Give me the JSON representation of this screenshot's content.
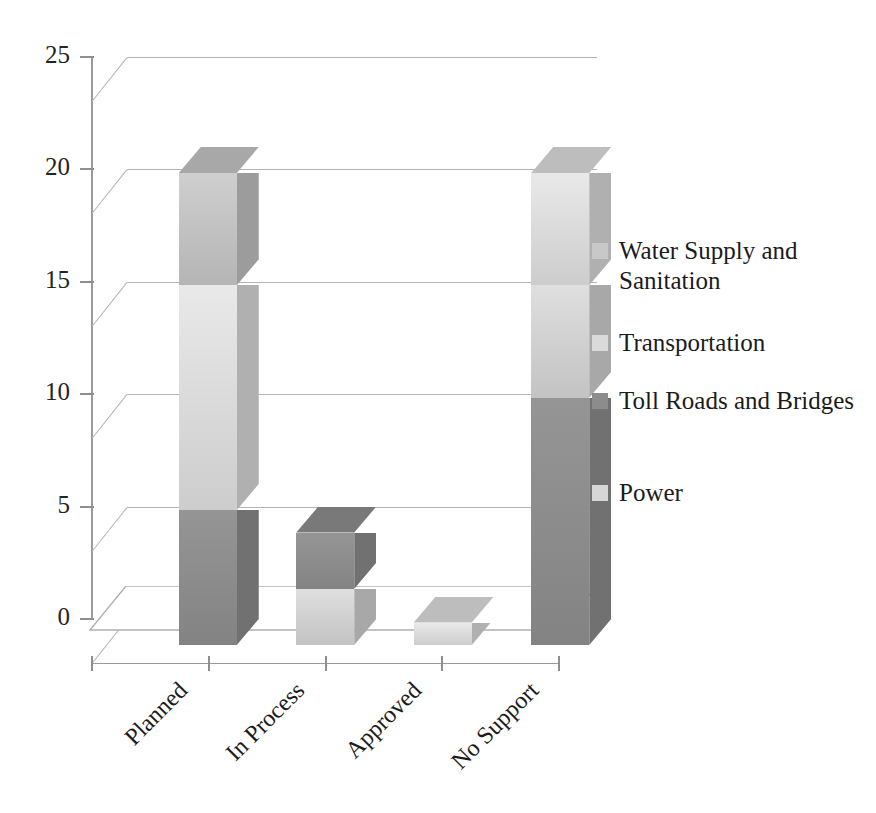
{
  "chart_data": {
    "type": "bar",
    "subtype": "stacked-column-3d",
    "title": "",
    "xlabel": "",
    "ylabel": "",
    "categories": [
      "Planned",
      "In Process",
      "Approved",
      "No Support"
    ],
    "ylim": [
      0,
      25
    ],
    "yticks": [
      0,
      5,
      10,
      15,
      20,
      25
    ],
    "ytick_labels": [
      "0",
      "5",
      "10",
      "15",
      "20",
      "25"
    ],
    "grid": true,
    "legend_position": "right",
    "series": [
      {
        "name": "Water Supply and Sanitation",
        "color": "#c3c3c3",
        "values": [
          5,
          0,
          0,
          0
        ]
      },
      {
        "name": "Transportation",
        "color": "#dcdcdc",
        "values": [
          10,
          0,
          1,
          5
        ]
      },
      {
        "name": "Toll Roads and Bridges",
        "color": "#8d8d8d",
        "values": [
          6,
          2.5,
          0,
          11
        ]
      },
      {
        "name": "Power",
        "color": "#d2d2d2",
        "values": [
          0,
          2.5,
          0,
          5
        ]
      }
    ],
    "totals": [
      21,
      5,
      1,
      21
    ]
  },
  "legend": {
    "items": [
      {
        "label": "Water Supply and Sanitation",
        "color": "#c8c8c8"
      },
      {
        "label": "Transportation",
        "color": "#dadada"
      },
      {
        "label": "Toll Roads and Bridges",
        "color": "#8c8c8c"
      },
      {
        "label": "Power",
        "color": "#d6d6d6"
      }
    ]
  },
  "axis": {
    "y_labels": [
      "25",
      "20",
      "15",
      "10",
      "5",
      "0"
    ],
    "x_labels": [
      "Planned",
      "In Process",
      "Approved",
      "No Support"
    ]
  },
  "colors": {
    "grid": "#b4b4b4",
    "axis": "#9a9a9a",
    "text": "#1b1b1b",
    "floor_fill": "#ffffff",
    "floor_stroke": "#b0b0b0"
  }
}
